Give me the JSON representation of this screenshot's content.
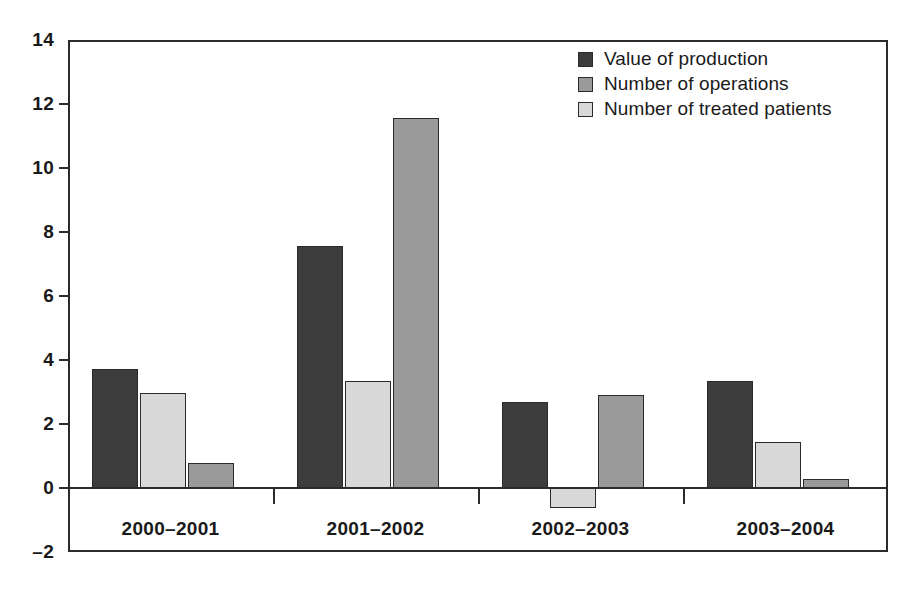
{
  "chart_data": {
    "type": "bar",
    "title": "",
    "subtitle": "",
    "xlabel": "",
    "ylabel": "",
    "categories": [
      "2000–2001",
      "2001–2002",
      "2002–2003",
      "2003–2004"
    ],
    "series": [
      {
        "name": "Value of production",
        "color": "#3d3d3d",
        "values": [
          3.72,
          7.55,
          2.7,
          3.35
        ]
      },
      {
        "name": "Number of treated patients",
        "color": "#d8d8d8",
        "values": [
          2.97,
          3.35,
          -0.62,
          1.45
        ]
      },
      {
        "name": "Number of operations",
        "color": "#9a9a9a",
        "values": [
          0.78,
          11.55,
          2.9,
          0.28
        ]
      }
    ],
    "legend_order": [
      "Value of production",
      "Number of operations",
      "Number of treated patients"
    ],
    "bar_draw_order": [
      "Value of production",
      "Number of treated patients",
      "Number of operations"
    ],
    "ylim": [
      -2,
      14
    ],
    "ytick_step": 2,
    "yticks": [
      "14",
      "12",
      "10",
      "8",
      "6",
      "4",
      "2",
      "0",
      "–2"
    ],
    "ytick_values": [
      14,
      12,
      10,
      8,
      6,
      4,
      2,
      0,
      -2
    ],
    "grid": false,
    "legend_position": "top-right",
    "zero_line": true,
    "axis_color": "#2b2b2b",
    "background": "#ffffff"
  },
  "legend": {
    "items": [
      {
        "label": "Value of production",
        "color": "#3d3d3d"
      },
      {
        "label": "Number of operations",
        "color": "#9a9a9a"
      },
      {
        "label": "Number of treated patients",
        "color": "#d8d8d8"
      }
    ]
  }
}
